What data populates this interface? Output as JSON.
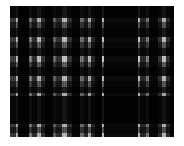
{
  "image": {
    "kind": "textile-swatch",
    "subject": "plaid-tartan-fabric",
    "colorspace": "grayscale",
    "background_color": "#ffffff",
    "width": 184,
    "height": 146,
    "alt_text": "Grayscale plaid tartan fabric swatch"
  },
  "panel": {
    "left": 10,
    "top": 6,
    "width": 164,
    "height": 131,
    "base_color": "#0a0a0a"
  },
  "palette": {
    "black": "#070707",
    "near_black": "#121212",
    "dark_gray": "#2b2b2b",
    "mid_dark_gray": "#454545",
    "mid_gray": "#6e6e6e",
    "light_gray": "#9a9a9a",
    "pale_gray": "#c2c2c2",
    "white_stripe": "#e8e8e8"
  },
  "chart_data": {
    "type": "heatmap",
    "xlabel": "warp (horizontal position, px)",
    "ylabel": "weft (vertical position, px)",
    "xlim": [
      0,
      164
    ],
    "ylim": [
      0,
      131
    ],
    "grid": false,
    "legend": "none",
    "warp_stripes": [
      {
        "x": 0,
        "w": 6,
        "value": 40,
        "color": "#454545"
      },
      {
        "x": 6,
        "w": 2,
        "value": 210,
        "color": "#d2d2d2"
      },
      {
        "x": 8,
        "w": 11,
        "value": 8,
        "color": "#070707"
      },
      {
        "x": 19,
        "w": 3,
        "value": 150,
        "color": "#969696"
      },
      {
        "x": 22,
        "w": 5,
        "value": 52,
        "color": "#343434"
      },
      {
        "x": 27,
        "w": 4,
        "value": 215,
        "color": "#d7d7d7"
      },
      {
        "x": 31,
        "w": 4,
        "value": 60,
        "color": "#3c3c3c"
      },
      {
        "x": 35,
        "w": 8,
        "value": 10,
        "color": "#0a0a0a"
      },
      {
        "x": 43,
        "w": 3,
        "value": 120,
        "color": "#787878"
      },
      {
        "x": 46,
        "w": 6,
        "value": 55,
        "color": "#373737"
      },
      {
        "x": 52,
        "w": 5,
        "value": 225,
        "color": "#e1e1e1"
      },
      {
        "x": 57,
        "w": 5,
        "value": 62,
        "color": "#3e3e3e"
      },
      {
        "x": 62,
        "w": 8,
        "value": 9,
        "color": "#090909"
      },
      {
        "x": 70,
        "w": 4,
        "value": 130,
        "color": "#828282"
      },
      {
        "x": 74,
        "w": 4,
        "value": 50,
        "color": "#323232"
      },
      {
        "x": 78,
        "w": 3,
        "value": 205,
        "color": "#cdcdcd"
      },
      {
        "x": 81,
        "w": 4,
        "value": 45,
        "color": "#2d2d2d"
      },
      {
        "x": 85,
        "w": 7,
        "value": 8,
        "color": "#080808"
      },
      {
        "x": 92,
        "w": 2,
        "value": 235,
        "color": "#ebebeb"
      },
      {
        "x": 94,
        "w": 34,
        "value": 12,
        "color": "#0c0c0c"
      },
      {
        "x": 128,
        "w": 2,
        "value": 230,
        "color": "#e6e6e6"
      },
      {
        "x": 130,
        "w": 6,
        "value": 48,
        "color": "#303030"
      },
      {
        "x": 136,
        "w": 3,
        "value": 140,
        "color": "#8c8c8c"
      },
      {
        "x": 139,
        "w": 9,
        "value": 9,
        "color": "#090909"
      },
      {
        "x": 148,
        "w": 4,
        "value": 58,
        "color": "#3a3a3a"
      },
      {
        "x": 152,
        "w": 4,
        "value": 220,
        "color": "#dcdcdc"
      },
      {
        "x": 156,
        "w": 4,
        "value": 52,
        "color": "#343434"
      },
      {
        "x": 160,
        "w": 8,
        "value": 10,
        "color": "#0a0a0a"
      }
    ],
    "weft_stripes": [
      {
        "y": 0,
        "h": 12,
        "value": 14,
        "color": "#0e0e0e"
      },
      {
        "y": 12,
        "h": 4,
        "value": 195,
        "color": "#c3c3c3"
      },
      {
        "y": 16,
        "h": 6,
        "value": 85,
        "color": "#555555"
      },
      {
        "y": 22,
        "h": 9,
        "value": 18,
        "color": "#121212"
      },
      {
        "y": 31,
        "h": 5,
        "value": 205,
        "color": "#cdcdcd"
      },
      {
        "y": 36,
        "h": 6,
        "value": 92,
        "color": "#5c5c5c"
      },
      {
        "y": 42,
        "h": 8,
        "value": 20,
        "color": "#141414"
      },
      {
        "y": 50,
        "h": 6,
        "value": 215,
        "color": "#d7d7d7"
      },
      {
        "y": 56,
        "h": 5,
        "value": 95,
        "color": "#5f5f5f"
      },
      {
        "y": 61,
        "h": 9,
        "value": 18,
        "color": "#121212"
      },
      {
        "y": 70,
        "h": 5,
        "value": 200,
        "color": "#c8c8c8"
      },
      {
        "y": 75,
        "h": 6,
        "value": 88,
        "color": "#585858"
      },
      {
        "y": 81,
        "h": 6,
        "value": 22,
        "color": "#161616"
      },
      {
        "y": 87,
        "h": 3,
        "value": 185,
        "color": "#b9b9b9"
      },
      {
        "y": 90,
        "h": 28,
        "value": 10,
        "color": "#0a0a0a"
      },
      {
        "y": 118,
        "h": 3,
        "value": 190,
        "color": "#bebebe"
      },
      {
        "y": 121,
        "h": 6,
        "value": 80,
        "color": "#505050"
      },
      {
        "y": 127,
        "h": 4,
        "value": 200,
        "color": "#c8c8c8"
      }
    ]
  }
}
